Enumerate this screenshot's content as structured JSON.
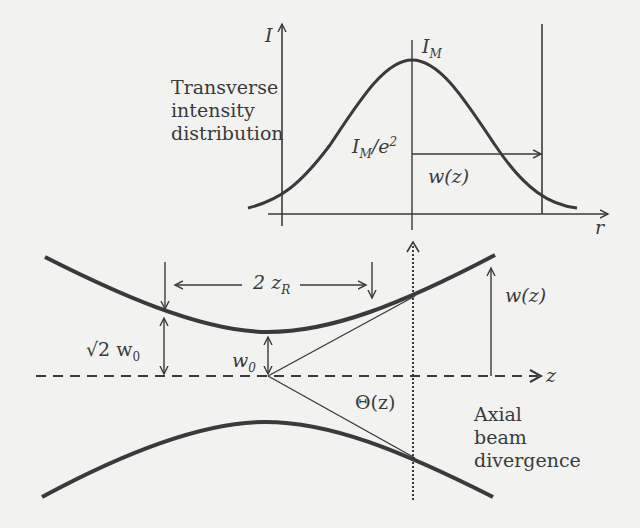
{
  "figure": {
    "top_panel": {
      "title_lines": [
        "Transverse",
        "intensity",
        "distribution"
      ],
      "y_axis_label": "I",
      "x_axis_label": "r",
      "peak_label_main": "I",
      "peak_label_sub": "M",
      "threshold_label_main": "I",
      "threshold_label_sub": "M",
      "threshold_label_rest": "/e",
      "threshold_label_sup": "2",
      "width_label": "w(z)"
    },
    "bottom_panel": {
      "rayleigh_label_main": "2 z",
      "rayleigh_label_sub": "R",
      "sqrt2_label_main": "√2 w",
      "sqrt2_label_sub": "0",
      "waist_label_main": "w",
      "waist_label_sub": "0",
      "beam_radius_label": "w(z)",
      "axis_label": "z",
      "divergence_angle_label": "Θ(z)",
      "divergence_caption_lines": [
        "Axial",
        "beam",
        "divergence"
      ]
    },
    "colors": {
      "ink": "#3a3a3a",
      "background": "#f2f2f0"
    }
  }
}
